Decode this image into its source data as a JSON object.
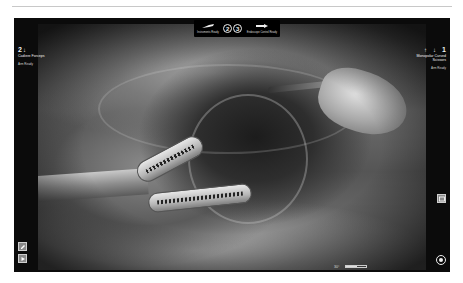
{
  "screen": {
    "title": "Surgical robot console endoscope view",
    "accent_color": "#f2f2f2",
    "background_color": "#0b0b0b"
  },
  "top_bar": {
    "left_icon": "instrument-icon",
    "left_label": "Instruments Ready",
    "center_circles": [
      "2",
      "3"
    ],
    "right_icon": "endoscope-icon",
    "right_label": "Endoscope Control Ready"
  },
  "left_arm": {
    "number": "2",
    "arrow": "↓",
    "instrument_name": "Cadiere Forceps",
    "sub_label": "Arm Ready"
  },
  "right_arm": {
    "number": "1",
    "arrow": "↓",
    "status_mark": "↑",
    "instrument_name": "Monopolar Curved Scissors",
    "sub_label": "Arm Ready"
  },
  "side_buttons": {
    "right_mid_icon": "camera-view-icon",
    "left_bottom_top_icon": "pencil-icon",
    "left_bottom_bottom_icon": "play-icon"
  },
  "bottom_bar": {
    "zoom_label": "30°",
    "energy_level_percent": 55,
    "energy_label": "Energy",
    "camera_icon": "camera-icon"
  }
}
